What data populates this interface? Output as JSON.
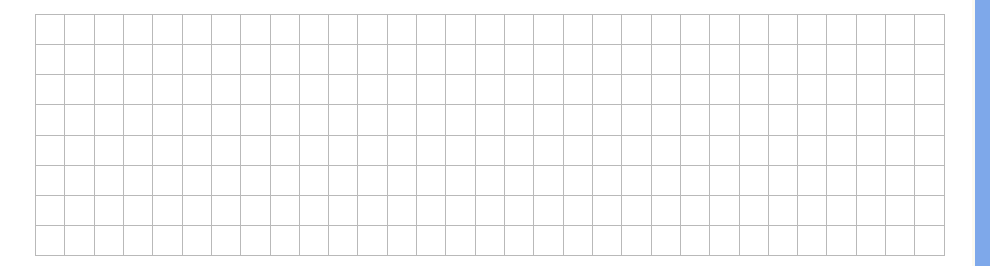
{
  "grid": {
    "columns": 31,
    "rows": 8,
    "cells_empty": true,
    "line_color": "#b9b9b9"
  },
  "side_panel": {
    "color": "#7ea8ea"
  }
}
